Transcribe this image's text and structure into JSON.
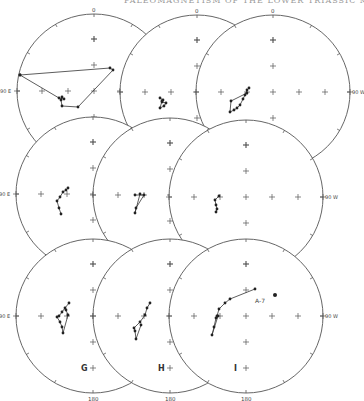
{
  "header": {
    "text": "PALEOMAGNETISM OF THE LOWER TRIASSIC MOENKOPI"
  },
  "figure": {
    "type": "stereonet_panels",
    "radius": 77,
    "panels": [
      {
        "id": "A",
        "label": "A",
        "cx": 94,
        "cy": 91,
        "top_label": "0",
        "left_label": "90 E"
      },
      {
        "id": "B",
        "label": "B",
        "cx": 197,
        "cy": 92,
        "top_label": "0"
      },
      {
        "id": "C",
        "label": "C",
        "cx": 273,
        "cy": 92,
        "top_label": "0",
        "right_label": "90 W"
      },
      {
        "id": "D",
        "label": "D",
        "cx": 93,
        "cy": 194,
        "left_label": "90 E"
      },
      {
        "id": "E",
        "label": "E",
        "cx": 170,
        "cy": 195
      },
      {
        "id": "F",
        "label": "F",
        "cx": 246,
        "cy": 197,
        "right_label": "90 W"
      },
      {
        "id": "G",
        "label": "G",
        "cx": 93,
        "cy": 316,
        "left_label": "90 E",
        "bottom_label": "180"
      },
      {
        "id": "H",
        "label": "H",
        "cx": 170,
        "cy": 316,
        "bottom_label": "180"
      },
      {
        "id": "I",
        "label": "I",
        "cx": 246,
        "cy": 316,
        "right_label": "90 W",
        "bottom_label": "180",
        "annotation": "A-7"
      }
    ]
  },
  "chart_data": {
    "type": "scatter",
    "panels": [
      {
        "name": "A",
        "points": [
          [
            20,
            75
          ],
          [
            110,
            68
          ],
          [
            113,
            70
          ],
          [
            78,
            107
          ],
          [
            62,
            106
          ],
          [
            61,
            100
          ],
          [
            62,
            97
          ],
          [
            64,
            99
          ],
          [
            59,
            98
          ],
          [
            20,
            75
          ]
        ],
        "connected": true
      },
      {
        "name": "B",
        "points": [
          [
            160,
            98
          ],
          [
            163,
            100
          ],
          [
            162,
            102
          ],
          [
            166,
            103
          ],
          [
            164,
            106
          ],
          [
            160,
            108
          ],
          [
            162,
            101
          ]
        ],
        "connected": true
      },
      {
        "name": "C",
        "points": [
          [
            249,
            88
          ],
          [
            247,
            90
          ],
          [
            245,
            95
          ],
          [
            243,
            99
          ],
          [
            240,
            105
          ],
          [
            237,
            108
          ],
          [
            234,
            110
          ],
          [
            230,
            112
          ],
          [
            231,
            101
          ],
          [
            247,
            93
          ]
        ],
        "connected": true
      },
      {
        "name": "D",
        "points": [
          [
            68,
            188
          ],
          [
            66,
            190
          ],
          [
            63,
            192
          ],
          [
            60,
            197
          ],
          [
            57,
            201
          ],
          [
            59,
            208
          ],
          [
            61,
            214
          ]
        ],
        "connected": true
      },
      {
        "name": "E",
        "points": [
          [
            135,
            195
          ],
          [
            144,
            195
          ],
          [
            136,
            208
          ],
          [
            135,
            213
          ],
          [
            140,
            194
          ]
        ],
        "connected": true
      },
      {
        "name": "F",
        "points": [
          [
            219,
            196
          ],
          [
            215,
            200
          ],
          [
            216,
            205
          ],
          [
            217,
            209
          ],
          [
            216,
            212
          ]
        ],
        "connected": true
      },
      {
        "name": "G",
        "points": [
          [
            69,
            303
          ],
          [
            65,
            308
          ],
          [
            62,
            312
          ],
          [
            59,
            316
          ],
          [
            57,
            317
          ],
          [
            60,
            322
          ],
          [
            62,
            327
          ],
          [
            63,
            333
          ],
          [
            68,
            315
          ],
          [
            66,
            310
          ]
        ],
        "connected": true
      },
      {
        "name": "H",
        "points": [
          [
            150,
            303
          ],
          [
            147,
            308
          ],
          [
            145,
            315
          ],
          [
            140,
            322
          ],
          [
            134,
            328
          ],
          [
            135,
            331
          ],
          [
            136,
            339
          ],
          [
            141,
            325
          ]
        ],
        "connected": true
      },
      {
        "name": "I",
        "points": [
          [
            255,
            289
          ],
          [
            230,
            299
          ],
          [
            225,
            303
          ],
          [
            219,
            309
          ],
          [
            217,
            316
          ],
          [
            216,
            318
          ],
          [
            214,
            327
          ],
          [
            212,
            335
          ],
          [
            218,
            316
          ]
        ],
        "connected": true,
        "extra_point": {
          "label": "A-7",
          "xy": [
            275,
            295
          ]
        }
      }
    ],
    "axis_labels": [
      "0",
      "90 E",
      "90 W",
      "180"
    ],
    "grid": false,
    "legend": null
  }
}
